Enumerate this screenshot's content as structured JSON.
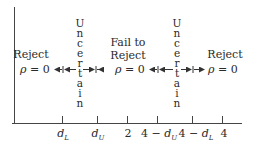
{
  "diagram": {
    "type": "durbin-watson-decision-regions",
    "regions": [
      {
        "label": "Reject",
        "sublabel": "ρ = 0"
      },
      {
        "label": "Uncertain"
      },
      {
        "label": "Fail to Reject",
        "line1": "Fail to",
        "line2": "Reject",
        "sublabel": "ρ = 0"
      },
      {
        "label": "Uncertain"
      },
      {
        "label": "Reject",
        "sublabel": "ρ = 0"
      }
    ],
    "ticks": [
      {
        "label": "d",
        "sub": "L",
        "prefix": ""
      },
      {
        "label": "d",
        "sub": "U",
        "prefix": ""
      },
      {
        "label": "2",
        "sub": "",
        "prefix": ""
      },
      {
        "label": "d",
        "sub": "U",
        "prefix": "4 − "
      },
      {
        "label": "d",
        "sub": "L",
        "prefix": "4 − "
      },
      {
        "label": "4",
        "sub": "",
        "prefix": ""
      }
    ],
    "uncertain_letters": [
      "U",
      "n",
      "c",
      "e",
      "r",
      "t",
      "a",
      "i",
      "n"
    ],
    "rho_symbol": "ρ",
    "rho_equals": " = 0"
  }
}
